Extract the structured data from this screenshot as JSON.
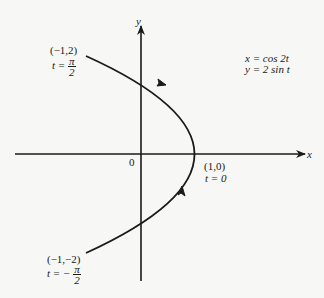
{
  "diagram": {
    "type": "parametric-curve",
    "equations": {
      "x": "x = cos 2t",
      "y": "y = 2 sin t"
    },
    "axes": {
      "x_label": "x",
      "y_label": "y",
      "origin_label": "0"
    },
    "points": [
      {
        "coord": "(−1,2)",
        "t_prefix": "t = ",
        "t_sign": "",
        "t_num": "π",
        "t_den": "2"
      },
      {
        "coord": "(1,0)",
        "t_text": "t = 0"
      },
      {
        "coord": "(−1,−2)",
        "t_prefix": "t = ",
        "t_sign": "− ",
        "t_num": "π",
        "t_den": "2"
      }
    ],
    "direction": "counter-clockwise from (−1,−2) through (1,0) to (−1,2)",
    "colors": {
      "ink": "#1a1a1a",
      "background": "#f7f7f5"
    }
  }
}
